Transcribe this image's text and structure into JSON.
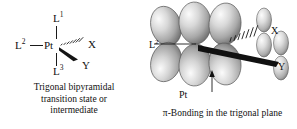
{
  "figure": {
    "background_color": "#ffffff",
    "ink_color": "#111111",
    "orbital_fill_light": "#f2f2f2",
    "orbital_fill_mid": "#b5b5b5",
    "orbital_fill_dark": "#6f6f6f",
    "orbital_outline": "#555555"
  },
  "left_panel": {
    "name": "trigonal-bipyramidal-structure",
    "center_atom": "Pt",
    "labels": {
      "axial_top": "L",
      "axial_top_sup": "1",
      "equatorial_left": "L",
      "equatorial_left_sup": "2",
      "axial_bottom": "L",
      "axial_bottom_sup": "3",
      "ligand_x": "X",
      "ligand_y": "Y"
    },
    "bonds": [
      {
        "from": "Pt",
        "to": "L1",
        "style": "plain-line",
        "direction": "up"
      },
      {
        "from": "Pt",
        "to": "L3",
        "style": "plain-line",
        "direction": "down"
      },
      {
        "from": "Pt",
        "to": "L2",
        "style": "plain-line",
        "direction": "left"
      },
      {
        "from": "Pt",
        "to": "X",
        "style": "hashed-wedge",
        "direction": "upper-right"
      },
      {
        "from": "Pt",
        "to": "Y",
        "style": "solid-wedge",
        "direction": "lower-right"
      }
    ],
    "caption_line1": "Trigonal bipyramidal",
    "caption_line2": "transition state or",
    "caption_line3": "intermediate"
  },
  "right_panel": {
    "name": "pi-bonding-orbital-diagram",
    "labels": {
      "equatorial_left": "L",
      "equatorial_left_sup": "2",
      "ligand_x": "X",
      "ligand_y": "Y",
      "metal_center": "Pt"
    },
    "bonds": [
      {
        "from": "Pt",
        "to": "L2",
        "style": "plain-line",
        "direction": "left"
      },
      {
        "from": "Pt",
        "to": "X",
        "style": "hashed-wedge",
        "direction": "upper-right"
      },
      {
        "from": "Pt",
        "to": "Y",
        "style": "solid-wedge",
        "direction": "lower-right"
      }
    ],
    "annotation_arrow": {
      "points_to": "Pt",
      "direction": "up"
    },
    "orbital_count_metal_lobes": 4,
    "orbital_count_ligand_sets": 2,
    "caption": "π-Bonding in the trigonal plane"
  }
}
